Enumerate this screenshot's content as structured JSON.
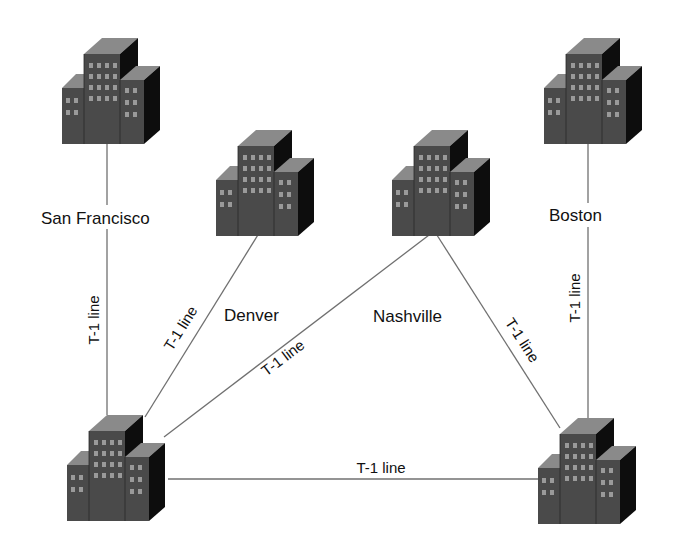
{
  "diagram": {
    "type": "network-topology",
    "colors": {
      "background": "#ffffff",
      "link": "#707070",
      "building_front": "#4a4a4a",
      "building_top": "#8a8a8a",
      "building_side": "#0d0d0d",
      "window": "#9a9a9a",
      "text": "#111111"
    },
    "nodes": [
      {
        "id": "san-francisco",
        "label": "San Francisco"
      },
      {
        "id": "denver",
        "label": "Denver"
      },
      {
        "id": "nashville",
        "label": "Nashville"
      },
      {
        "id": "boston",
        "label": "Boston"
      },
      {
        "id": "hub-west",
        "label": ""
      },
      {
        "id": "hub-east",
        "label": ""
      }
    ],
    "links": [
      {
        "from": "san-francisco",
        "to": "hub-west",
        "label": "T-1 line"
      },
      {
        "from": "denver",
        "to": "hub-west",
        "label": "T-1 line"
      },
      {
        "from": "nashville",
        "to": "hub-west",
        "label": "T-1 line"
      },
      {
        "from": "nashville",
        "to": "hub-east",
        "label": "T-1 line"
      },
      {
        "from": "boston",
        "to": "hub-east",
        "label": "T-1 line"
      },
      {
        "from": "hub-west",
        "to": "hub-east",
        "label": "T-1 line"
      }
    ]
  }
}
